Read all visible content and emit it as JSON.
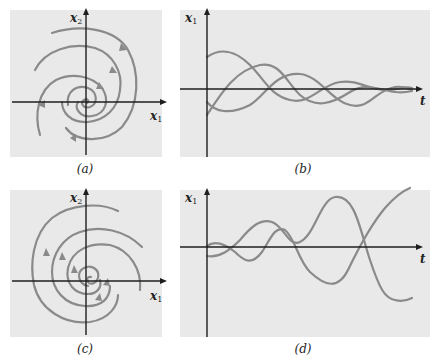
{
  "figure": {
    "panels": [
      {
        "id": "a",
        "caption": "(a)",
        "type": "phase-portrait",
        "x_label": "x",
        "x_sub": "1",
        "y_label": "x",
        "y_sub": "2",
        "behavior": "stable spiral (trajectories converge inward)"
      },
      {
        "id": "b",
        "caption": "(b)",
        "type": "time-series",
        "y_label": "x",
        "y_sub": "1",
        "x_label": "t",
        "behavior": "damped oscillations decaying to zero"
      },
      {
        "id": "c",
        "caption": "(c)",
        "type": "phase-portrait",
        "x_label": "x",
        "x_sub": "1",
        "y_label": "x",
        "y_sub": "2",
        "behavior": "unstable spiral (trajectories diverge outward)"
      },
      {
        "id": "d",
        "caption": "(d)",
        "type": "time-series",
        "y_label": "x",
        "y_sub": "1",
        "x_label": "t",
        "behavior": "growing oscillations"
      }
    ],
    "colors": {
      "panel_background": "#e9e9e9",
      "axis": "#1e1e1e",
      "curve": "#8a8a8a",
      "page": "#ffffff"
    }
  }
}
